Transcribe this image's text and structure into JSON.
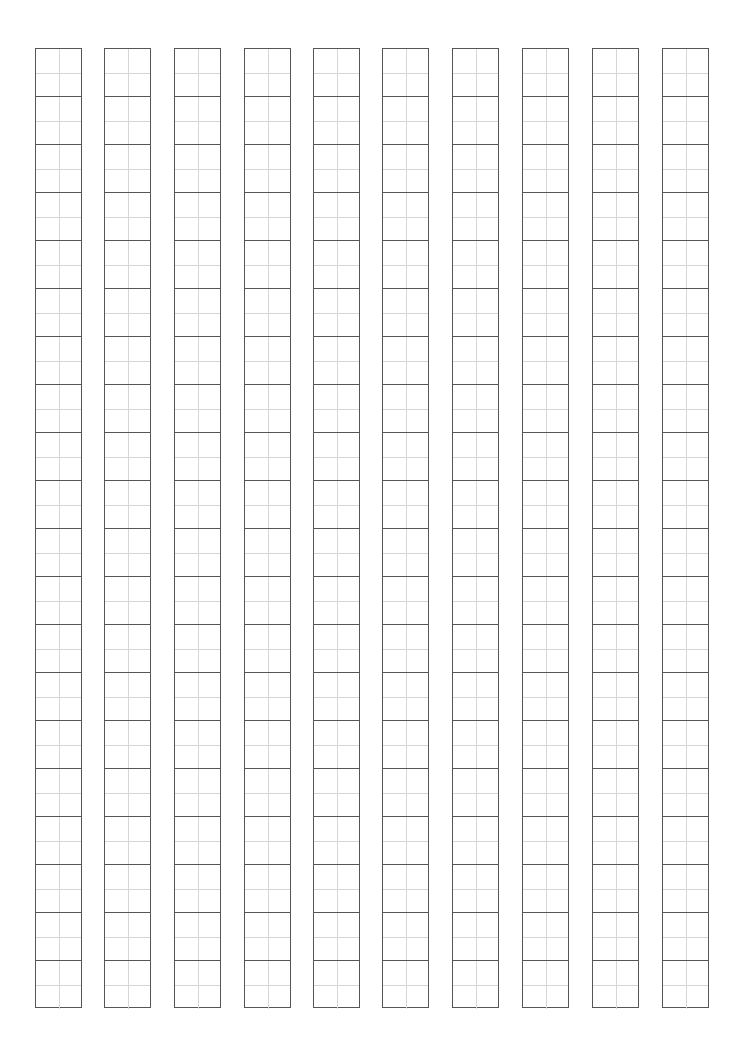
{
  "sheet": {
    "type": "character-practice-grid",
    "columns": 10,
    "rows_per_column": 20,
    "cell_guides": "cross (vertical + horizontal midlines)",
    "column_left_edges": [
      35,
      104,
      174,
      244,
      313,
      382,
      452,
      522,
      592,
      662
    ],
    "line_color": "#555555",
    "guide_color": "#d6d6d6"
  }
}
